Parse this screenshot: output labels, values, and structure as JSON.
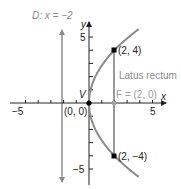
{
  "chart_data": {
    "type": "line",
    "title": "",
    "xlabel": "x",
    "ylabel": "y",
    "xlim": [
      -6.2,
      6
    ],
    "ylim": [
      -6.3,
      6.2
    ],
    "x_ticks": [
      -5,
      -4,
      -3,
      -2,
      -1,
      1,
      2,
      3,
      4,
      5
    ],
    "y_ticks": [
      -5,
      -4,
      -3,
      -2,
      -1,
      1,
      2,
      3,
      4,
      5
    ],
    "x_tick_labels": [
      {
        "value": -5,
        "text": "−5"
      },
      {
        "value": 5,
        "text": "5"
      }
    ],
    "y_tick_labels": [
      {
        "value": 5,
        "text": "5"
      },
      {
        "value": -5,
        "text": "−5"
      }
    ],
    "series": [
      {
        "name": "parabola y^2 = 8x",
        "equation": "y^2 = 8x",
        "color": "#8a8a8a",
        "y_range": [
          -5.6,
          5.6
        ]
      }
    ],
    "directrix": {
      "label": "D: x = −2",
      "x": -2,
      "color": "#8a8a8a"
    },
    "latus_rectum": {
      "label": "Latus rectum",
      "x": 2,
      "from_y": -4,
      "to_y": 4,
      "color": "#555555"
    },
    "points": [
      {
        "x": 0,
        "y": 0,
        "label": "(0, 0)",
        "name": "V",
        "color": "#000000"
      },
      {
        "x": 2,
        "y": 4,
        "label": "(2, 4)",
        "color": "#000000"
      },
      {
        "x": 2,
        "y": -4,
        "label": "(2, −4)",
        "color": "#000000"
      },
      {
        "x": 2,
        "y": 0,
        "label": "F = (2, 0)",
        "color": "#9a9a9a"
      }
    ]
  },
  "labels": {
    "directrix": "D: x = −2",
    "y_axis": "y",
    "x_axis": "x",
    "y_top": "5",
    "y_bottom": "−5",
    "x_left": "−5",
    "x_right": "5",
    "vertex_name": "V",
    "origin": "(0, 0)",
    "focus": "F = (2, 0)",
    "point_upper": "(2, 4)",
    "point_lower": "(2, −4)",
    "latus_rectum": "Latus rectum"
  },
  "colors": {
    "axis": "#222222",
    "curve": "#8a8a8a",
    "directrix": "#8a8a8a",
    "gray_text": "#8a8a8a",
    "point": "#000000",
    "focus": "#a0a0a0"
  }
}
